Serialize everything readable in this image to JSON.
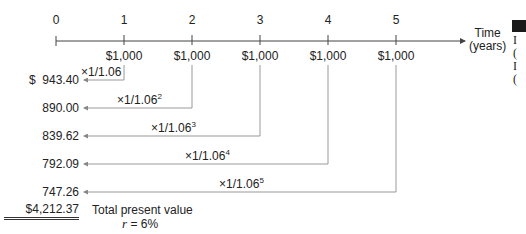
{
  "timeline": {
    "axis_title_line1": "Time",
    "axis_title_line2": "(years)",
    "ticks": [
      "0",
      "1",
      "2",
      "3",
      "4",
      "5"
    ],
    "cash_flows": [
      "$1,000",
      "$1,000",
      "$1,000",
      "$1,000",
      "$1,000"
    ]
  },
  "discounting": {
    "rows": [
      {
        "year": 1,
        "present_value": "$  943.40",
        "factor_base": "×1/1.06",
        "exponent": ""
      },
      {
        "year": 2,
        "present_value": "890.00",
        "factor_base": "×1/1.06",
        "exponent": "2"
      },
      {
        "year": 3,
        "present_value": "839.62",
        "factor_base": "×1/1.06",
        "exponent": "3"
      },
      {
        "year": 4,
        "present_value": "792.09",
        "factor_base": "×1/1.06",
        "exponent": "4"
      },
      {
        "year": 5,
        "present_value": "747.26",
        "factor_base": "×1/1.06",
        "exponent": "5"
      }
    ]
  },
  "summary": {
    "total": "$4,212.37",
    "total_label": "Total present value",
    "rate_symbol": "r",
    "rate_value": " = 6%"
  },
  "side_fragment": {
    "letters": [
      "I",
      "(",
      "I",
      "("
    ]
  },
  "colors": {
    "line": "#9a9a9a",
    "axis": "#444444",
    "text": "#222222"
  }
}
